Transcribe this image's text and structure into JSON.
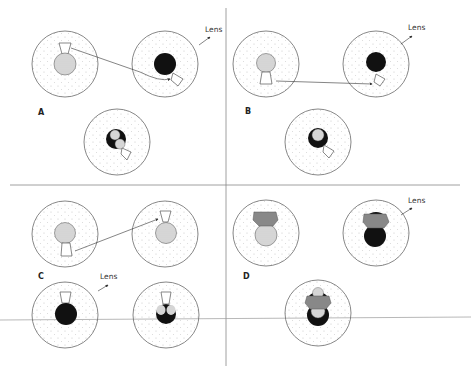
{
  "panels": [
    {
      "id": "A",
      "label": "A",
      "lens_label": "Lens"
    },
    {
      "id": "B",
      "label": "B",
      "lens_label": "Lens"
    },
    {
      "id": "C",
      "label": "C",
      "lens_label": "Lens"
    },
    {
      "id": "D",
      "label": "D",
      "lens_label": "Lens"
    }
  ],
  "colors": {
    "outline": "#6a6a6a",
    "pupil_light": "#d8d8d8",
    "pupil_dark": "#111111",
    "cone_fill": "#ffffff",
    "implant_gray": "#8a8a8a",
    "stipple": "#c8c8c8"
  }
}
